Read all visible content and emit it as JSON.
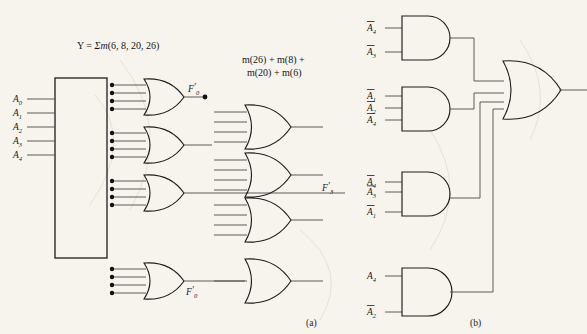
{
  "figure": {
    "title_equation": "Y = Σm(6, 8, 20, 26)",
    "minterm_note_line1": "m(26) + m(8) +",
    "minterm_note_line2": "m(20) + m(6)",
    "caption_a": "(a)",
    "caption_b": "(b)"
  },
  "decoder": {
    "inputs": [
      {
        "name": "A",
        "sub": "0"
      },
      {
        "name": "A",
        "sub": "1"
      },
      {
        "name": "A",
        "sub": "2"
      },
      {
        "name": "A",
        "sub": "3"
      },
      {
        "name": "A",
        "sub": "4"
      }
    ]
  },
  "signal_labels": {
    "f_top": {
      "name": "F",
      "prime": "′",
      "sub": "0"
    },
    "f_mid": {
      "name": "F",
      "prime": "′",
      "sub": "3"
    },
    "f_bottom": {
      "name": "F",
      "prime": "′",
      "sub": "0"
    }
  },
  "and_gates": [
    {
      "id": "and-1",
      "inputs": [
        {
          "name": "A",
          "sub": "4",
          "bar": true
        },
        {
          "name": "A",
          "sub": "3",
          "bar": true
        }
      ]
    },
    {
      "id": "and-2",
      "inputs": [
        {
          "name": "A",
          "sub": "1",
          "bar": true
        },
        {
          "name": "A",
          "sub": "2",
          "bar": true
        },
        {
          "name": "A",
          "sub": "4",
          "bar": true
        }
      ]
    },
    {
      "id": "and-3",
      "inputs": [
        {
          "name": "A",
          "sub": "4",
          "bar": true
        },
        {
          "name": "A",
          "sub": "3",
          "bar": true
        },
        {
          "name": "A",
          "sub": "1",
          "bar": true
        }
      ]
    },
    {
      "id": "and-4",
      "inputs": [
        {
          "name": "A",
          "sub": "4",
          "bar": false
        },
        {
          "name": "A",
          "sub": "2",
          "bar": true
        }
      ]
    }
  ],
  "colors": {
    "ink": "#1c1c1c",
    "wire": "#4a4a4a",
    "paper": "#fbfaf7"
  }
}
